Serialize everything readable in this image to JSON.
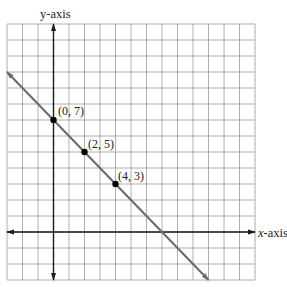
{
  "chart_data": {
    "type": "line",
    "title": "",
    "xlabel": "x-axis",
    "ylabel": "y-axis",
    "xlim": [
      -3,
      13
    ],
    "ylim": [
      -3,
      13
    ],
    "grid": true,
    "grid_step": 1,
    "equation": "y = -x + 7",
    "line": {
      "x": [
        -3,
        10
      ],
      "y": [
        10,
        -3
      ],
      "arrow_start": true,
      "arrow_end": true
    },
    "points": [
      {
        "x": 0,
        "y": 7,
        "label": "(0, 7)"
      },
      {
        "x": 2,
        "y": 5,
        "label": "(2, 5)"
      },
      {
        "x": 4,
        "y": 3,
        "label": "(4, 3)"
      }
    ]
  },
  "labels": {
    "x_axis_italic": "x",
    "x_axis_rest": "-axis",
    "y_axis": "y-axis",
    "p0": "(0, 7)",
    "p1": "(2, 5)",
    "p2": "(4, 3)"
  },
  "colors": {
    "grid": "#9a9a9a",
    "axis": "#1a1a1a",
    "line": "#6a6a6a",
    "point": "#000000"
  }
}
